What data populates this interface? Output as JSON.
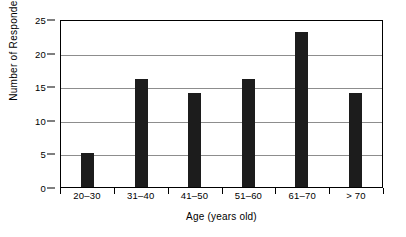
{
  "chart_data": {
    "type": "bar",
    "title": "",
    "xlabel": "Age (years old)",
    "ylabel": "Number of Respondents",
    "categories": [
      "20–30",
      "31–40",
      "41–50",
      "51–60",
      "61–70",
      "> 70"
    ],
    "values": [
      5,
      16,
      14,
      16,
      23,
      14
    ],
    "ylim": [
      0,
      25
    ],
    "yticks": [
      0,
      5,
      10,
      15,
      20,
      25
    ],
    "ytick_labels": [
      "0",
      "5",
      "10",
      "15",
      "20",
      "25"
    ],
    "grid": true,
    "legend": false,
    "bar_color": "#1c1c1c",
    "grid_color": "#8d8d8d",
    "axis_color": "#000000",
    "background": "#ffffff"
  }
}
